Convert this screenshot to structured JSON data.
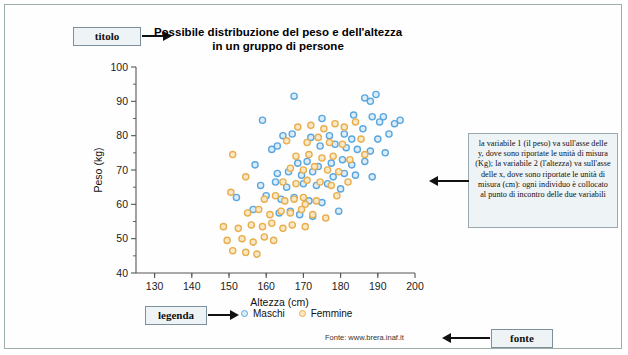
{
  "figure": {
    "title_line1": "Possibile distribuzione del peso e dell'altezza",
    "title_line2": "in un gruppo di persone",
    "source_text": "Fonte: www.brera.inaf.it"
  },
  "callouts": {
    "titolo": "titolo",
    "legenda": "legenda",
    "fonte": "fonte"
  },
  "annotation": {
    "text": "la variabile 1 (il peso) va sull'asse delle y, dove sono riportate le unità di misura (Kg); la variabile 2 (l'altezza) va sull'asse delle x, dove sono riportate le unità di misura (cm): ogni individuo è collocato al punto di incontro delle due variabili"
  },
  "colors": {
    "maschi_stroke": "#5aa7de",
    "maschi_fill": "#dcecf8",
    "femmine_stroke": "#e8ae4e",
    "femmine_fill": "#fae7c4",
    "axis": "#555555",
    "frame": "#9fb0a8",
    "callout_bg": "#eef3f6"
  },
  "chart_data": {
    "type": "scatter",
    "title": "Possibile distribuzione del peso e dell'altezza in un gruppo di persone",
    "xlabel": "Altezza (cm)",
    "ylabel": "Peso (kg)",
    "xlim": [
      125,
      200
    ],
    "ylim": [
      40,
      100
    ],
    "xticks": [
      130,
      140,
      150,
      160,
      170,
      180,
      190,
      200
    ],
    "yticks": [
      40,
      50,
      60,
      70,
      80,
      90,
      100
    ],
    "grid": false,
    "legend_position": "below-plot",
    "series": [
      {
        "name": "Maschi",
        "color": "#5aa7de",
        "points": [
          [
            167.5,
            91.5
          ],
          [
            186.5,
            91.0
          ],
          [
            188.0,
            90.0
          ],
          [
            189.5,
            92.0
          ],
          [
            159.0,
            84.5
          ],
          [
            175.0,
            85.0
          ],
          [
            183.5,
            86.0
          ],
          [
            188.5,
            85.5
          ],
          [
            190.5,
            84.0
          ],
          [
            191.5,
            85.5
          ],
          [
            194.5,
            83.5
          ],
          [
            196.0,
            84.5
          ],
          [
            164.5,
            80.0
          ],
          [
            167.0,
            80.5
          ],
          [
            172.0,
            79.5
          ],
          [
            177.0,
            80.0
          ],
          [
            181.0,
            80.5
          ],
          [
            183.0,
            79.0
          ],
          [
            186.0,
            82.0
          ],
          [
            190.0,
            79.0
          ],
          [
            193.0,
            80.5
          ],
          [
            161.5,
            76.0
          ],
          [
            163.0,
            77.0
          ],
          [
            174.5,
            77.0
          ],
          [
            178.5,
            77.5
          ],
          [
            181.5,
            76.5
          ],
          [
            184.5,
            76.0
          ],
          [
            188.0,
            75.5
          ],
          [
            192.0,
            75.0
          ],
          [
            157.0,
            71.5
          ],
          [
            168.5,
            72.0
          ],
          [
            171.0,
            72.5
          ],
          [
            174.0,
            71.0
          ],
          [
            177.5,
            72.0
          ],
          [
            180.5,
            73.0
          ],
          [
            183.0,
            71.5
          ],
          [
            186.5,
            72.5
          ],
          [
            163.0,
            69.0
          ],
          [
            166.0,
            69.5
          ],
          [
            169.5,
            68.5
          ],
          [
            172.5,
            69.5
          ],
          [
            178.0,
            68.0
          ],
          [
            181.0,
            69.0
          ],
          [
            184.0,
            68.5
          ],
          [
            188.5,
            68.0
          ],
          [
            158.5,
            65.5
          ],
          [
            162.5,
            66.5
          ],
          [
            165.5,
            65.0
          ],
          [
            170.0,
            66.0
          ],
          [
            173.5,
            65.5
          ],
          [
            176.5,
            66.0
          ],
          [
            180.0,
            64.5
          ],
          [
            152.0,
            62.0
          ],
          [
            160.0,
            62.5
          ],
          [
            164.0,
            61.5
          ],
          [
            167.5,
            62.0
          ],
          [
            171.5,
            61.0
          ],
          [
            175.0,
            60.5
          ],
          [
            156.5,
            58.5
          ],
          [
            163.5,
            57.5
          ],
          [
            166.5,
            58.0
          ],
          [
            169.0,
            57.0
          ],
          [
            172.5,
            56.5
          ],
          [
            179.5,
            58.0
          ]
        ]
      },
      {
        "name": "Femmine",
        "color": "#e8ae4e",
        "points": [
          [
            168.5,
            82.5
          ],
          [
            172.0,
            83.0
          ],
          [
            175.5,
            82.0
          ],
          [
            178.5,
            83.5
          ],
          [
            181.0,
            82.5
          ],
          [
            184.0,
            84.0
          ],
          [
            165.5,
            78.5
          ],
          [
            171.0,
            78.0
          ],
          [
            174.0,
            79.5
          ],
          [
            177.0,
            78.0
          ],
          [
            180.5,
            77.5
          ],
          [
            185.5,
            79.0
          ],
          [
            151.0,
            74.5
          ],
          [
            168.0,
            74.0
          ],
          [
            171.5,
            74.5
          ],
          [
            175.0,
            73.5
          ],
          [
            178.0,
            74.0
          ],
          [
            182.5,
            73.0
          ],
          [
            186.5,
            74.5
          ],
          [
            166.5,
            70.5
          ],
          [
            170.0,
            70.0
          ],
          [
            173.0,
            71.0
          ],
          [
            176.5,
            70.0
          ],
          [
            179.5,
            69.5
          ],
          [
            154.5,
            68.0
          ],
          [
            164.5,
            66.5
          ],
          [
            168.0,
            66.0
          ],
          [
            171.0,
            67.0
          ],
          [
            174.5,
            66.5
          ],
          [
            177.5,
            65.5
          ],
          [
            182.0,
            66.5
          ],
          [
            150.5,
            63.5
          ],
          [
            159.5,
            61.5
          ],
          [
            162.5,
            62.5
          ],
          [
            165.0,
            61.0
          ],
          [
            167.5,
            61.5
          ],
          [
            170.0,
            62.0
          ],
          [
            170.5,
            60.0
          ],
          [
            173.5,
            61.0
          ],
          [
            179.0,
            62.5
          ],
          [
            155.0,
            57.5
          ],
          [
            158.0,
            58.5
          ],
          [
            161.0,
            57.0
          ],
          [
            164.0,
            58.0
          ],
          [
            166.5,
            57.5
          ],
          [
            169.5,
            58.5
          ],
          [
            172.5,
            57.0
          ],
          [
            176.0,
            56.0
          ],
          [
            148.5,
            53.5
          ],
          [
            152.5,
            53.0
          ],
          [
            156.0,
            54.0
          ],
          [
            159.0,
            53.5
          ],
          [
            161.5,
            54.5
          ],
          [
            164.5,
            53.0
          ],
          [
            167.0,
            54.0
          ],
          [
            170.5,
            53.5
          ],
          [
            149.5,
            49.5
          ],
          [
            153.5,
            50.0
          ],
          [
            156.5,
            49.0
          ],
          [
            159.5,
            50.5
          ],
          [
            162.0,
            49.5
          ],
          [
            151.0,
            46.5
          ],
          [
            154.5,
            46.0
          ],
          [
            157.5,
            45.5
          ]
        ]
      }
    ]
  }
}
